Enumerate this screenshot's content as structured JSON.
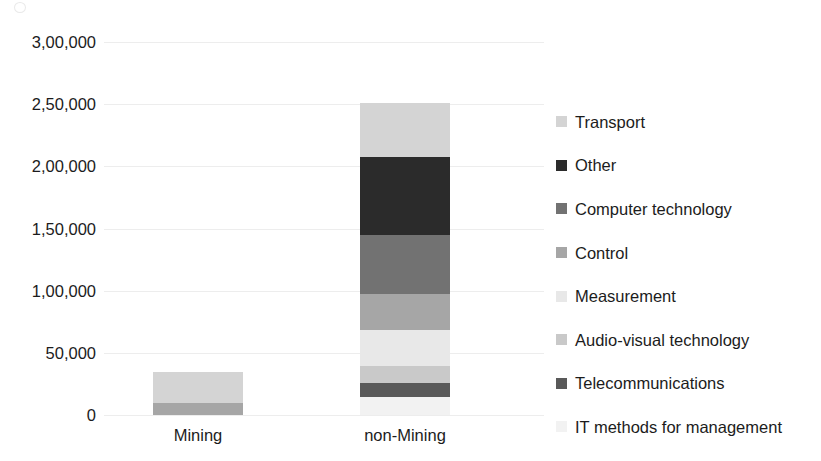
{
  "chart_data": {
    "type": "bar",
    "subtype": "stacked-bar",
    "title": "",
    "xlabel": "",
    "ylabel": "",
    "categories": [
      "Mining",
      "non-Mining"
    ],
    "ylim": [
      0,
      300000
    ],
    "ytick_values": [
      0,
      50000,
      100000,
      150000,
      200000,
      250000,
      300000
    ],
    "ytick_labels": [
      "0",
      "50,000",
      "1,00,000",
      "1,50,000",
      "2,00,000",
      "2,50,000",
      "3,00,000"
    ],
    "grid": true,
    "legend_position": "right",
    "number_format": "indian-lakh",
    "series": [
      {
        "name": "IT methods for management",
        "color": "#f2f2f2",
        "values": [
          0,
          14500
        ]
      },
      {
        "name": "Telecommunications",
        "color": "#595959",
        "values": [
          0,
          11300
        ]
      },
      {
        "name": "Audio-visual technology",
        "color": "#c9c9c9",
        "values": [
          0,
          13700
        ]
      },
      {
        "name": "Measurement",
        "color": "#e8e8e8",
        "values": [
          0,
          29000
        ]
      },
      {
        "name": "Control",
        "color": "#a6a6a6",
        "values": [
          9500,
          29000
        ]
      },
      {
        "name": "Computer technology",
        "color": "#727272",
        "values": [
          0,
          47500
        ]
      },
      {
        "name": "Other",
        "color": "#2b2b2b",
        "values": [
          0,
          62700
        ]
      },
      {
        "name": "Transport",
        "color": "#d4d4d4",
        "values": [
          25500,
          43500
        ]
      }
    ],
    "stack_order_bottom_to_top": [
      "IT methods for management",
      "Telecommunications",
      "Audio-visual technology",
      "Measurement",
      "Control",
      "Computer technology",
      "Other",
      "Transport"
    ],
    "totals": [
      35000,
      251200
    ]
  },
  "legend": {
    "items": [
      {
        "label": "Transport",
        "color": "#d4d4d4"
      },
      {
        "label": "Other",
        "color": "#2b2b2b"
      },
      {
        "label": "Computer technology",
        "color": "#727272"
      },
      {
        "label": "Control",
        "color": "#a6a6a6"
      },
      {
        "label": "Measurement",
        "color": "#e8e8e8"
      },
      {
        "label": "Audio-visual technology",
        "color": "#c9c9c9"
      },
      {
        "label": "Telecommunications",
        "color": "#595959"
      },
      {
        "label": "IT methods for management",
        "color": "#f2f2f2"
      }
    ]
  },
  "axis": {
    "y_labels": [
      "3,00,000",
      "2,50,000",
      "2,00,000",
      "1,50,000",
      "1,00,000",
      "50,000",
      "0"
    ],
    "x_labels": [
      "Mining",
      "non-Mining"
    ]
  },
  "colors": {
    "gridline": "#ededed",
    "text": "#1c1c1c",
    "background": "#ffffff"
  }
}
